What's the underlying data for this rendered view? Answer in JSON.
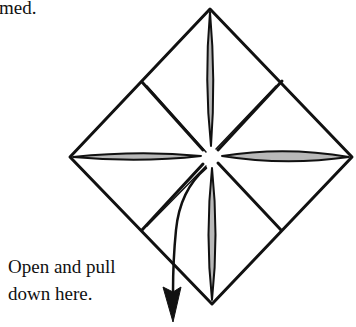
{
  "top_text": "med.",
  "instruction": {
    "line1": "Open and pull",
    "line2": "down here."
  },
  "diagram": {
    "outer_diamond": {
      "top": [
        210,
        9
      ],
      "right": [
        352,
        157
      ],
      "bottom": [
        212,
        304
      ],
      "left": [
        70,
        157
      ]
    },
    "inner_square": {
      "tl": [
        142,
        82
      ],
      "tr": [
        282,
        81
      ],
      "br": [
        281,
        230
      ],
      "bl": [
        142,
        230
      ]
    },
    "center": [
      211,
      156
    ],
    "colors": {
      "stroke": "#111111",
      "fold_fill": "#b8b8b8",
      "paper": "#ffffff"
    }
  }
}
